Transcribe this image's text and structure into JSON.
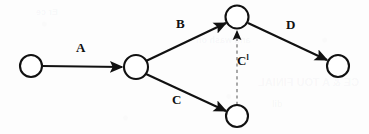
{
  "diagram": {
    "type": "directed-graph",
    "background_color": "#fdfdfd",
    "stroke_color": "#111111",
    "dashed_color": "#9a9a9a",
    "node_fill": "#ffffff",
    "nodes": [
      {
        "id": "n1",
        "label": "",
        "cx": 31,
        "cy": 66,
        "r": 11
      },
      {
        "id": "n2",
        "label": "",
        "cx": 136,
        "cy": 67,
        "r": 12
      },
      {
        "id": "n3",
        "label": "",
        "cx": 237,
        "cy": 17,
        "r": 11.5
      },
      {
        "id": "n4",
        "label": "",
        "cx": 237,
        "cy": 116,
        "r": 11
      },
      {
        "id": "n5",
        "label": "",
        "cx": 338,
        "cy": 66,
        "r": 11
      }
    ],
    "edges": [
      {
        "id": "e-a",
        "label": "A",
        "from": "n1",
        "to": "n2",
        "style": "solid",
        "arrow": true,
        "x1": 42,
        "y1": 66,
        "x2": 122,
        "y2": 67,
        "label_x": 76,
        "label_y": 41
      },
      {
        "id": "e-b",
        "label": "B",
        "from": "n2",
        "to": "n3",
        "style": "solid",
        "arrow": true,
        "x1": 146,
        "y1": 61,
        "x2": 226,
        "y2": 23,
        "label_x": 176,
        "label_y": 17
      },
      {
        "id": "e-c",
        "label": "C",
        "from": "n2",
        "to": "n4",
        "style": "solid",
        "arrow": true,
        "x1": 146,
        "y1": 74,
        "x2": 226,
        "y2": 111,
        "label_x": 172,
        "label_y": 93
      },
      {
        "id": "e-d",
        "label": "D",
        "from": "n3",
        "to": "n5",
        "style": "solid",
        "arrow": true,
        "x1": 248,
        "y1": 23,
        "x2": 327,
        "y2": 60,
        "label_x": 286,
        "label_y": 18
      },
      {
        "id": "e-cp",
        "label": "C",
        "label_sup": "l",
        "from": "n4",
        "to": "n3",
        "style": "dashed",
        "arrow": true,
        "x1": 237,
        "y1": 105,
        "x2": 237,
        "y2": 30,
        "label_x": 237,
        "label_y": 54
      }
    ],
    "ghost_marks": [
      {
        "text": "CE & A TOU FINIAL",
        "x": 258,
        "y": 82,
        "size": 11
      },
      {
        "text": "and wash on",
        "x": 196,
        "y": 40,
        "size": 9
      },
      {
        "text": "dil",
        "x": 272,
        "y": 104,
        "size": 9
      },
      {
        "text": "Er ce",
        "x": 36,
        "y": 12,
        "size": 9
      }
    ]
  }
}
